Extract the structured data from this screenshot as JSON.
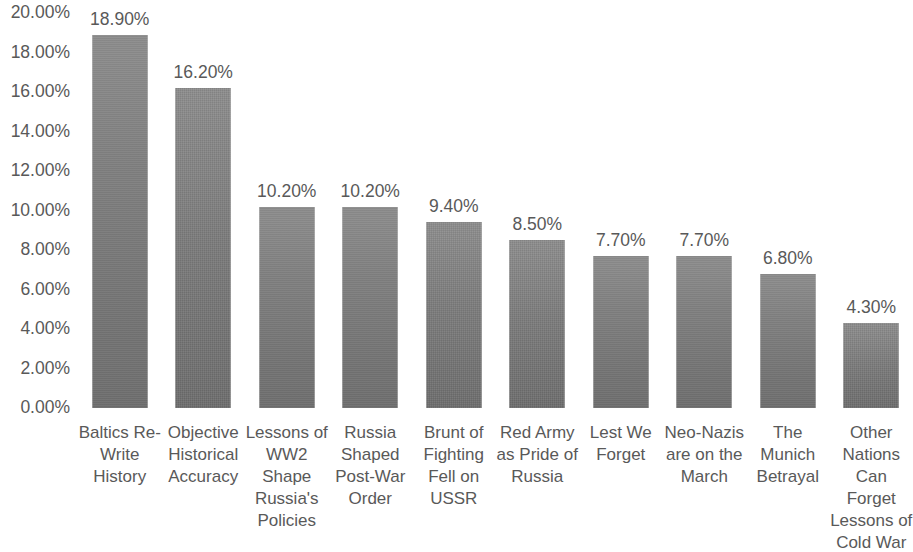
{
  "chart_data": {
    "type": "bar",
    "title": "",
    "subtitle": "",
    "xlabel": "",
    "ylabel": "",
    "ylim": [
      0,
      20
    ],
    "y_ticks": [
      "0.00%",
      "2.00%",
      "4.00%",
      "6.00%",
      "8.00%",
      "10.00%",
      "12.00%",
      "14.00%",
      "16.00%",
      "18.00%",
      "20.00%"
    ],
    "y_tick_values": [
      0,
      2,
      4,
      6,
      8,
      10,
      12,
      14,
      16,
      18,
      20
    ],
    "grid": false,
    "legend": false,
    "legend_position": "none",
    "bar_color": "#808080",
    "text_color": "#595959",
    "categories": [
      "Baltics Re-Write History",
      "Objective Historical Accuracy",
      "Lessons of WW2 Shape Russia's Policies",
      "Russia Shaped Post-War Order",
      "Brunt of Fighting Fell on USSR",
      "Red Army as Pride of Russia",
      "Lest We Forget",
      "Neo-Nazis are on the March",
      "The Munich Betrayal",
      "Other Nations Can Forget Lessons of Cold War"
    ],
    "category_lines": [
      [
        "Baltics Re-",
        "Write",
        "History"
      ],
      [
        "Objective",
        "Historical",
        "Accuracy"
      ],
      [
        "Lessons of",
        "WW2",
        "Shape",
        "Russia's",
        "Policies"
      ],
      [
        "Russia",
        "Shaped",
        "Post-War",
        "Order"
      ],
      [
        "Brunt of",
        "Fighting",
        "Fell on",
        "USSR"
      ],
      [
        "Red Army",
        "as Pride of",
        "Russia"
      ],
      [
        "Lest We",
        "Forget"
      ],
      [
        "Neo-Nazis",
        "are on the",
        "March"
      ],
      [
        "The",
        "Munich",
        "Betrayal"
      ],
      [
        "Other",
        "Nations",
        "Can Forget",
        "Lessons of",
        "Cold War"
      ]
    ],
    "values": [
      18.9,
      16.2,
      10.2,
      10.2,
      9.4,
      8.5,
      7.7,
      7.7,
      6.8,
      4.3
    ],
    "value_labels": [
      "18.90%",
      "16.20%",
      "10.20%",
      "10.20%",
      "9.40%",
      "8.50%",
      "7.70%",
      "7.70%",
      "6.80%",
      "4.30%"
    ]
  }
}
